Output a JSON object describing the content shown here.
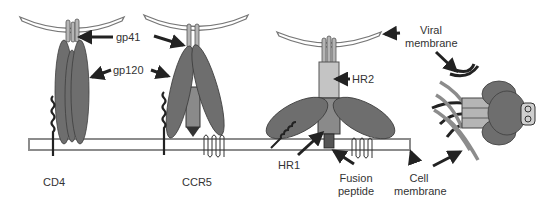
{
  "figure": {
    "stages": [
      {
        "id": "cd4-binding",
        "receptor_label": "CD4"
      },
      {
        "id": "coreceptor-binding",
        "receptor_label": "CCR5"
      },
      {
        "id": "fusion-intermediate"
      },
      {
        "id": "six-helix-bundle"
      }
    ],
    "labels": {
      "gp41": "gp41",
      "gp120": "gp120",
      "cd4": "CD4",
      "ccr5": "CCR5",
      "hr2": "HR2",
      "hr1": "HR1",
      "fusion_peptide_line1": "Fusion",
      "fusion_peptide_line2": "peptide",
      "viral_membrane_line1": "Viral",
      "viral_membrane_line2": "membrane",
      "cell_membrane_line1": "Cell",
      "cell_membrane_line2": "membrane"
    },
    "colors": {
      "gp120": "#6e6e6e",
      "gp41": "#a8a8a8",
      "membrane_outline": "#8c8c8c",
      "arrow": "#222222",
      "text": "#333333",
      "background": "#ffffff"
    }
  }
}
